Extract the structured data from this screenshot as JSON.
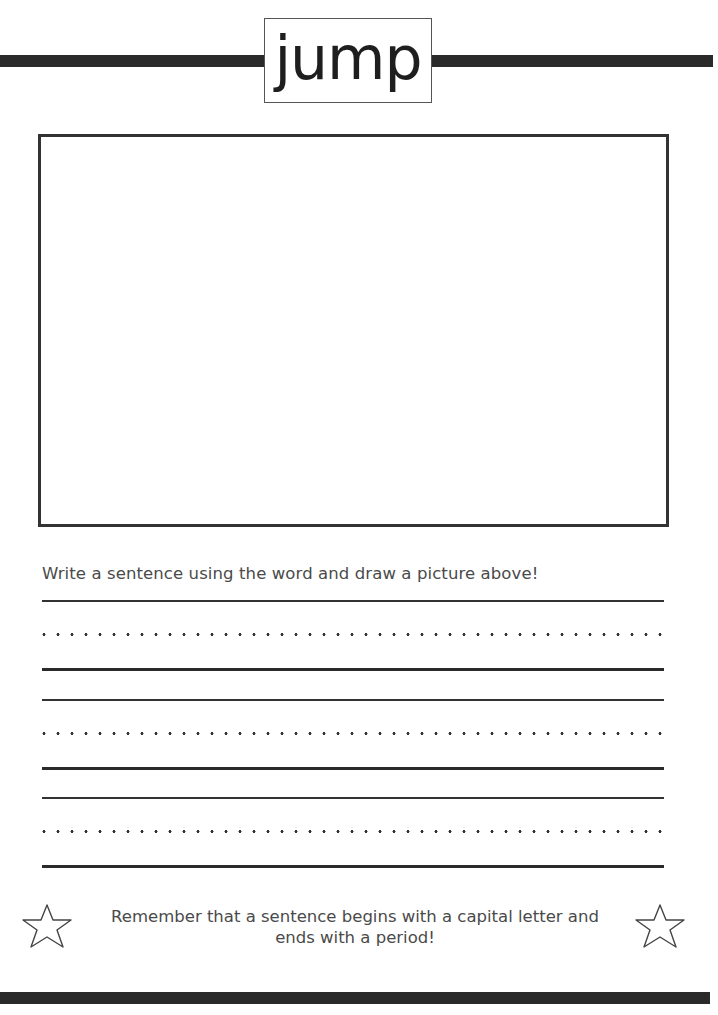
{
  "worksheet": {
    "word": "jump",
    "instruction": "Write a sentence using the word and draw a picture above!",
    "writing_lines": [
      {
        "top_y": 600,
        "dotted_y": 634,
        "base_y": 669
      },
      {
        "top_y": 699,
        "dotted_y": 733,
        "base_y": 768
      },
      {
        "top_y": 797,
        "dotted_y": 831,
        "base_y": 866
      }
    ],
    "reminder": {
      "line1": "Remember that a sentence begins with a capital letter and",
      "line2": "ends with a period!",
      "left_icon": "star-outline-icon",
      "right_icon": "star-outline-icon"
    },
    "colors": {
      "bar": "#2a2a2a",
      "text": "#4a4a4a",
      "word": "#1e1e1e",
      "border": "#333333"
    }
  }
}
